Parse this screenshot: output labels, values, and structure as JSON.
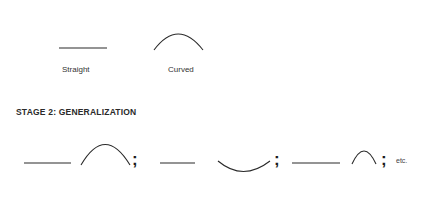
{
  "stage1": {
    "examples": [
      {
        "shape": "straight-line",
        "label": "Straight"
      },
      {
        "shape": "curved-arc",
        "label": "Curved"
      }
    ]
  },
  "stage2": {
    "heading": "STAGE 2: GENERALIZATION",
    "sequence": [
      {
        "shape": "straight-line"
      },
      {
        "shape": "arc-up-large"
      },
      {
        "separator": ";"
      },
      {
        "shape": "straight-line-short"
      },
      {
        "shape": "arc-down-shallow"
      },
      {
        "separator": ";"
      },
      {
        "shape": "straight-line"
      },
      {
        "shape": "arc-up-small"
      },
      {
        "separator": ";"
      }
    ],
    "separator": ";",
    "trailing": "etc."
  },
  "colors": {
    "stroke": "#2a2a2a",
    "background": "#ffffff"
  }
}
